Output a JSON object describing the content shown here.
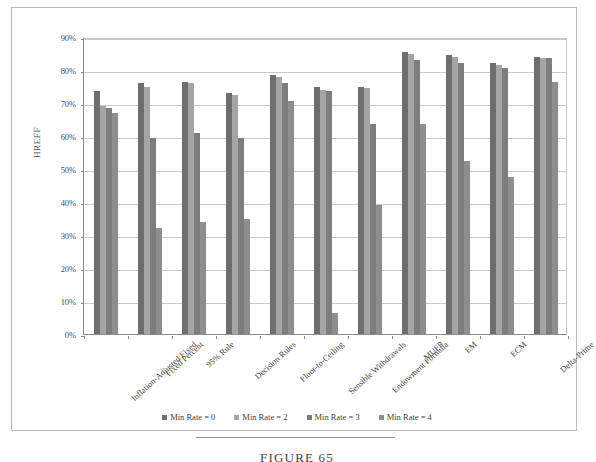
{
  "chart_data": {
    "type": "bar",
    "title": "",
    "xlabel": "",
    "ylabel": "HREFF",
    "ylim": [
      0,
      90
    ],
    "y_tick_labels": [
      "90%",
      "80%",
      "70%",
      "60%",
      "50%",
      "40%",
      "30%",
      "20%",
      "10%",
      "0%"
    ],
    "y_tick_values": [
      90,
      80,
      70,
      60,
      50,
      40,
      30,
      20,
      10,
      0
    ],
    "grid": true,
    "legend_position": "bottom",
    "categories": [
      "Inflation-Adjusted Fixed",
      "Fixed Percent",
      "95% Rule",
      "Decision Rules",
      "Floor-to-Ceiling",
      "Sensible Withdrawals",
      "Endowment Formula",
      "MUFP",
      "EM",
      "ECM",
      "Delta-Prime"
    ],
    "series": [
      {
        "name": "Min Rate = 0",
        "color": "#6e6e6e",
        "values": [
          73.5,
          76.0,
          76.5,
          73.0,
          78.5,
          75.0,
          75.0,
          85.5,
          84.5,
          82.0,
          84.0
        ]
      },
      {
        "name": "Min Rate = 2",
        "color": "#a5a5a5",
        "values": [
          69.0,
          75.0,
          76.0,
          72.5,
          78.0,
          74.0,
          74.5,
          85.0,
          84.0,
          81.5,
          83.5
        ]
      },
      {
        "name": "Min Rate = 3",
        "color": "#7d7d7d",
        "values": [
          68.5,
          59.5,
          61.0,
          59.5,
          76.0,
          73.5,
          63.5,
          83.0,
          82.0,
          80.5,
          83.5
        ]
      },
      {
        "name": "Min Rate = 4",
        "color": "#8e8e8e",
        "values": [
          67.0,
          32.0,
          34.0,
          35.0,
          70.5,
          6.5,
          39.0,
          63.5,
          52.5,
          47.5,
          76.5
        ]
      }
    ]
  },
  "caption": {
    "text": "FIGURE 65"
  }
}
